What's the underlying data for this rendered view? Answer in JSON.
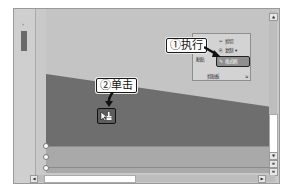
{
  "left_panel": {
    "collapse_arrow": "›"
  },
  "ribbon": {
    "group_label": "剪贴板",
    "paste_label": "粘贴",
    "items": [
      {
        "icon": "scissors-icon",
        "glyph": "✂",
        "label": "剪切"
      },
      {
        "icon": "copy-icon",
        "glyph": "⎘",
        "label": "复制",
        "dropdown": "▾"
      },
      {
        "icon": "format-painter-icon",
        "glyph": "✎",
        "label": "格式刷"
      }
    ],
    "launcher_glyph": "⇲"
  },
  "annotations": {
    "step1": "①执行",
    "step2": "②单击"
  },
  "scrollbars": {
    "up": "▲",
    "down": "▼",
    "left": "◀",
    "right": "▶",
    "prev": "≡",
    "next": "≡"
  },
  "colors": {
    "slide_bg": "#c4c4c4",
    "shape_fill": "#6e6e6e",
    "band_fill": "#a9a9a9"
  }
}
